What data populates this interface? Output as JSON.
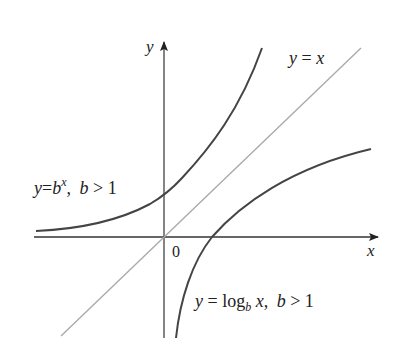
{
  "figure": {
    "axes": {
      "x_label": "x",
      "y_label": "y",
      "origin_label": "0"
    },
    "curves": [
      {
        "name": "exponential",
        "label_y": "y",
        "label_eq": "=",
        "label_base": "b",
        "label_exp": "x",
        "label_cond": ", ",
        "label_cond_var": "b",
        "label_cond_rest": " > 1",
        "color": "#444444"
      },
      {
        "name": "identity",
        "label_y": "y",
        "label_eq": " = ",
        "label_x": "x",
        "color": "#aaaaaa"
      },
      {
        "name": "logarithm",
        "label_y": "y",
        "label_eq": " = ",
        "label_log": "log",
        "label_sub": "b",
        "label_x": " x",
        "label_cond": ", ",
        "label_cond_var": "b",
        "label_cond_rest": " > 1",
        "color": "#444444"
      }
    ]
  }
}
